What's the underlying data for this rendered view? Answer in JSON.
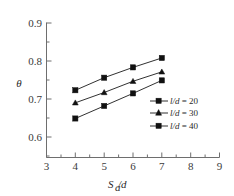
{
  "chart_data": {
    "type": "line",
    "title": "",
    "xlabel": "Sa/d",
    "ylabel": "θ",
    "xlim": [
      3,
      9
    ],
    "ylim": [
      0.6,
      0.9
    ],
    "grid": false,
    "legend_position": "center-right",
    "x": [
      4,
      5,
      6,
      7
    ],
    "xticks": [
      "3",
      "4",
      "5",
      "6",
      "7",
      "8",
      "9"
    ],
    "yticks": [
      "0.6",
      "0.7",
      "0.8",
      "0.9"
    ],
    "series": [
      {
        "name": "l/d = 20",
        "marker": "square",
        "values": [
          0.75,
          0.778,
          0.801,
          0.822
        ]
      },
      {
        "name": "l/d = 30",
        "marker": "triangle",
        "values": [
          0.722,
          0.745,
          0.77,
          0.791
        ]
      },
      {
        "name": "l/d = 40",
        "marker": "square",
        "values": [
          0.687,
          0.715,
          0.743,
          0.772
        ]
      }
    ]
  },
  "axes": {
    "y_title": "θ",
    "x_title_main": "S",
    "x_title_sub": "a",
    "x_title_tail": "/d"
  },
  "legend": {
    "entries": [
      {
        "symbol_var": "l/d",
        "equals": " = ",
        "value": "20"
      },
      {
        "symbol_var": "l/d",
        "equals": " = ",
        "value": "30"
      },
      {
        "symbol_var": "l/d",
        "equals": " = ",
        "value": "40"
      }
    ]
  },
  "colors": {
    "line": "#1a1a1a",
    "marker": "#111111",
    "axis": "#6e6e6e",
    "text": "#2a2a2a",
    "background": "#ffffff"
  }
}
